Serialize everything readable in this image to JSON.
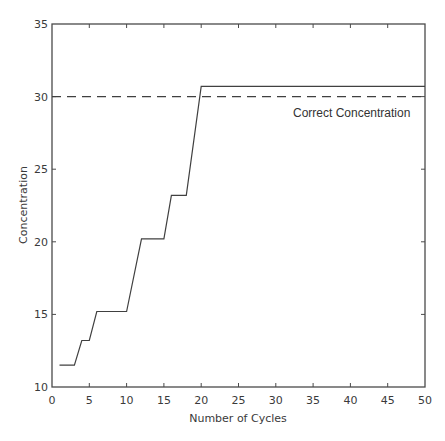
{
  "chart_data": {
    "type": "line",
    "title": "",
    "xlabel": "Number of Cycles",
    "ylabel": "Concentration",
    "xlim": [
      0,
      50
    ],
    "ylim": [
      10,
      35
    ],
    "xticks": [
      0,
      5,
      10,
      15,
      20,
      25,
      30,
      35,
      40,
      45,
      50
    ],
    "yticks": [
      10,
      15,
      20,
      25,
      30,
      35
    ],
    "grid": false,
    "legend": null,
    "series": [
      {
        "name": "Concentration",
        "style": "solid",
        "color": "#404040",
        "x": [
          1,
          3,
          4,
          5,
          6,
          10,
          12,
          15,
          16,
          18,
          20,
          50
        ],
        "y": [
          11.5,
          11.5,
          13.2,
          13.2,
          15.2,
          15.2,
          20.2,
          20.2,
          23.2,
          23.2,
          30.7,
          30.7
        ]
      },
      {
        "name": "Correct Concentration",
        "style": "dashed",
        "color": "#404040",
        "x": [
          0,
          50
        ],
        "y": [
          30,
          30
        ]
      }
    ],
    "annotations": [
      {
        "text": "Correct Concentration",
        "x": 42,
        "y": 28.9
      }
    ]
  }
}
